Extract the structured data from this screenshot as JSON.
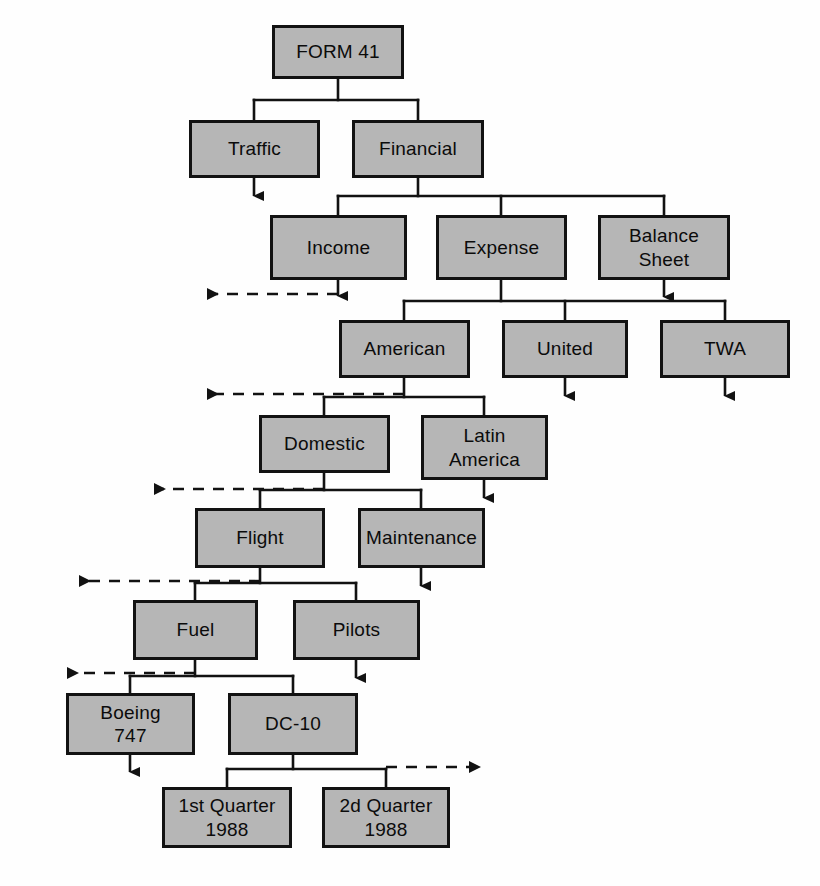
{
  "diagram": {
    "colors": {
      "node_fill": "#b6b6b6",
      "node_border": "#121212",
      "wire": "#121212",
      "background": "#fefefe"
    },
    "nodes": [
      {
        "id": "form41",
        "label": "FORM 41",
        "x": 272,
        "y": 25,
        "w": 132,
        "h": 54,
        "level": 0
      },
      {
        "id": "traffic",
        "label": "Traffic",
        "x": 189,
        "y": 120,
        "w": 131,
        "h": 58,
        "level": 1
      },
      {
        "id": "financial",
        "label": "Financial",
        "x": 352,
        "y": 120,
        "w": 132,
        "h": 58,
        "level": 1
      },
      {
        "id": "income",
        "label": "Income",
        "x": 270,
        "y": 215,
        "w": 137,
        "h": 65,
        "level": 2
      },
      {
        "id": "expense",
        "label": "Expense",
        "x": 436,
        "y": 215,
        "w": 131,
        "h": 65,
        "level": 2
      },
      {
        "id": "balance",
        "label": "Balance\nSheet",
        "x": 598,
        "y": 215,
        "w": 132,
        "h": 65,
        "level": 2
      },
      {
        "id": "american",
        "label": "American",
        "x": 339,
        "y": 320,
        "w": 131,
        "h": 58,
        "level": 3
      },
      {
        "id": "united",
        "label": "United",
        "x": 502,
        "y": 320,
        "w": 126,
        "h": 58,
        "level": 3
      },
      {
        "id": "twa",
        "label": "TWA",
        "x": 660,
        "y": 320,
        "w": 130,
        "h": 58,
        "level": 3
      },
      {
        "id": "domestic",
        "label": "Domestic",
        "x": 259,
        "y": 415,
        "w": 131,
        "h": 58,
        "level": 4
      },
      {
        "id": "latin",
        "label": "Latin\nAmerica",
        "x": 421,
        "y": 415,
        "w": 127,
        "h": 65,
        "level": 4
      },
      {
        "id": "flight",
        "label": "Flight",
        "x": 195,
        "y": 508,
        "w": 130,
        "h": 60,
        "level": 5
      },
      {
        "id": "maint",
        "label": "Maintenance",
        "x": 358,
        "y": 508,
        "w": 127,
        "h": 60,
        "level": 5
      },
      {
        "id": "fuel",
        "label": "Fuel",
        "x": 133,
        "y": 600,
        "w": 125,
        "h": 60,
        "level": 6
      },
      {
        "id": "pilots",
        "label": "Pilots",
        "x": 293,
        "y": 600,
        "w": 127,
        "h": 60,
        "level": 6
      },
      {
        "id": "boeing",
        "label": "Boeing\n747",
        "x": 66,
        "y": 693,
        "w": 129,
        "h": 62,
        "level": 7
      },
      {
        "id": "dc10",
        "label": "DC-10",
        "x": 228,
        "y": 693,
        "w": 130,
        "h": 62,
        "level": 7
      },
      {
        "id": "q1",
        "label": "1st Quarter\n1988",
        "x": 162,
        "y": 787,
        "w": 130,
        "h": 61,
        "level": 8
      },
      {
        "id": "q2",
        "label": "2d Quarter\n1988",
        "x": 322,
        "y": 787,
        "w": 128,
        "h": 61,
        "level": 8
      }
    ],
    "connections": [
      {
        "from": "form41",
        "to": [
          "traffic",
          "financial"
        ]
      },
      {
        "from": "financial",
        "to": [
          "income",
          "expense",
          "balance"
        ]
      },
      {
        "from": "expense",
        "to": [
          "american",
          "united",
          "twa"
        ]
      },
      {
        "from": "american",
        "to": [
          "domestic",
          "latin"
        ]
      },
      {
        "from": "domestic",
        "to": [
          "flight",
          "maint"
        ]
      },
      {
        "from": "flight",
        "to": [
          "fuel",
          "pilots"
        ]
      },
      {
        "from": "fuel",
        "to": [
          "boeing",
          "dc10"
        ]
      },
      {
        "from": "dc10",
        "to": [
          "q1",
          "q2"
        ]
      }
    ],
    "terminal_arrows": [
      {
        "from": "traffic",
        "direction": "down"
      },
      {
        "from": "income",
        "direction": "down"
      },
      {
        "from": "balance",
        "direction": "down"
      },
      {
        "from": "united",
        "direction": "down"
      },
      {
        "from": "twa",
        "direction": "down"
      },
      {
        "from": "latin",
        "direction": "down"
      },
      {
        "from": "maint",
        "direction": "down"
      },
      {
        "from": "pilots",
        "direction": "down"
      },
      {
        "from": "boeing",
        "direction": "down"
      }
    ],
    "continuation_arrows": [
      {
        "label": "more-under-financial",
        "direction": "left",
        "y": 294
      },
      {
        "label": "more-under-expense",
        "direction": "left",
        "y": 394
      },
      {
        "label": "more-under-american",
        "direction": "left",
        "y": 489
      },
      {
        "label": "more-under-domestic",
        "direction": "left",
        "y": 581
      },
      {
        "label": "more-under-flight",
        "direction": "left",
        "y": 673
      },
      {
        "label": "more-under-dc10",
        "direction": "right",
        "y": 767
      }
    ]
  }
}
